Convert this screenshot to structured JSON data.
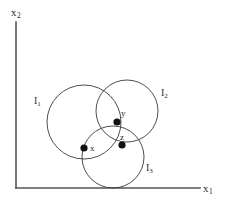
{
  "figure": {
    "background_color": "#ffffff",
    "stroke_color": "#3a3a3a",
    "axis_color": "#555555",
    "point_color": "#111111",
    "width": 228,
    "height": 204
  },
  "axes": {
    "y_axis": {
      "label_base": "x",
      "label_sub": "2",
      "x1": 16,
      "y1": 22,
      "x2": 16,
      "y2": 188,
      "label_x": 11,
      "label_y": 6
    },
    "x_axis": {
      "label_base": "x",
      "label_sub": "1",
      "x1": 16,
      "y1": 188,
      "x2": 200,
      "y2": 188,
      "label_x": 203,
      "label_y": 182
    }
  },
  "chart_data": {
    "type": "diagram",
    "title": "",
    "xlabel": "x1",
    "ylabel": "x2",
    "circles": [
      {
        "id": "I1",
        "label_base": "I",
        "label_sub": "1",
        "cx": 84,
        "cy": 122,
        "r": 37,
        "label_x": 34,
        "label_y": 95
      },
      {
        "id": "I2",
        "label_base": "I",
        "label_sub": "2",
        "cx": 127,
        "cy": 111,
        "r": 31,
        "label_x": 161,
        "label_y": 87
      },
      {
        "id": "I3",
        "label_base": "I",
        "label_sub": "3",
        "cx": 113,
        "cy": 157,
        "r": 31,
        "label_x": 146,
        "label_y": 162
      }
    ],
    "points": [
      {
        "id": "x",
        "label": "x",
        "cx": 84,
        "cy": 148,
        "r": 3.6,
        "label_x": 90,
        "label_y": 143
      },
      {
        "id": "y",
        "label": "y",
        "cx": 117,
        "cy": 122,
        "r": 3.6,
        "label_x": 121,
        "label_y": 108
      },
      {
        "id": "z",
        "label": "z",
        "cx": 122,
        "cy": 145,
        "r": 3.6,
        "label_x": 120,
        "label_y": 132
      }
    ],
    "grid": false,
    "legend": "none"
  }
}
